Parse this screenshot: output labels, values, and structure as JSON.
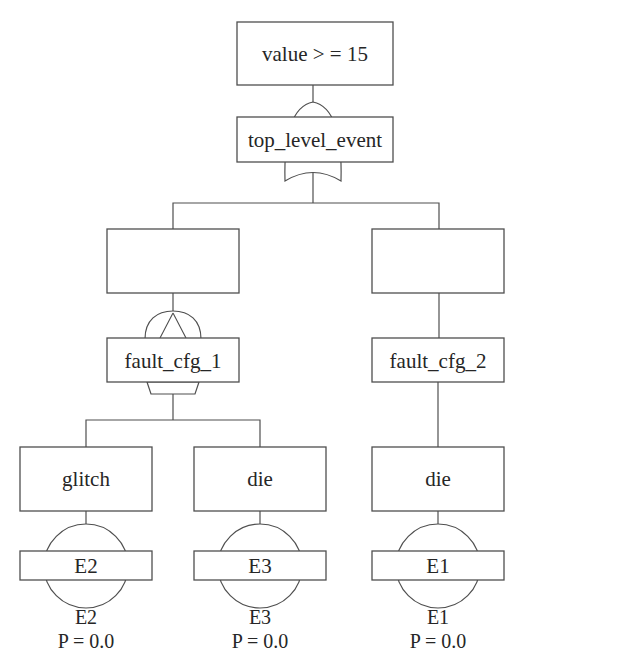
{
  "diagram_type": "fault-tree",
  "colors": {
    "background": "#ffffff",
    "line": "#4f4f4f",
    "text": "#262626"
  },
  "icons": {
    "or_gate": "or-gate-icon",
    "priority_and_gate": "priority-and-gate-icon",
    "basic_event": "basic-event-circle-icon"
  },
  "condition": {
    "label": "value > = 15"
  },
  "top_event": {
    "label": "top_level_event"
  },
  "left": {
    "config": {
      "label": "fault_cfg_1"
    },
    "children": [
      {
        "label": "glitch",
        "event_id": "E2",
        "caption": "E2",
        "probability": "P = 0.0"
      },
      {
        "label": "die",
        "event_id": "E3",
        "caption": "E3",
        "probability": "P = 0.0"
      }
    ]
  },
  "right": {
    "config": {
      "label": "fault_cfg_2"
    },
    "children": [
      {
        "label": "die",
        "event_id": "E1",
        "caption": "E1",
        "probability": "P = 0.0"
      }
    ]
  }
}
